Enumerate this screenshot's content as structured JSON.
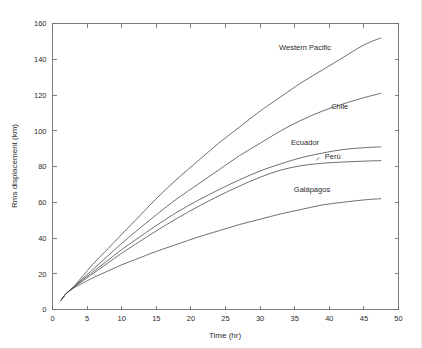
{
  "chart_data": {
    "type": "line",
    "title": "",
    "xlabel": "Time (hr)",
    "ylabel": "Rms displacement (km)",
    "xlim": [
      0,
      50
    ],
    "ylim": [
      0,
      160
    ],
    "xticks": [
      0,
      5,
      10,
      15,
      20,
      25,
      30,
      35,
      40,
      45,
      50
    ],
    "yticks": [
      0,
      20,
      40,
      60,
      80,
      100,
      120,
      140,
      160
    ],
    "grid": false,
    "legend_position": "inline-annotations",
    "line_color": "#555555",
    "series": [
      {
        "name": "Western Pacific",
        "label": "Western Pacific",
        "x": [
          1.2,
          2,
          3,
          4,
          6,
          8,
          10,
          12,
          15,
          18,
          21,
          24,
          27,
          30,
          33,
          36,
          39,
          42,
          45,
          47.5
        ],
        "values": [
          5,
          9,
          12.5,
          17,
          26,
          34,
          42,
          50,
          62,
          73,
          83,
          93,
          102,
          111,
          119,
          127,
          134,
          141,
          148,
          152
        ]
      },
      {
        "name": "Chile",
        "label": "Chile",
        "x": [
          1.2,
          2,
          3,
          4,
          6,
          8,
          10,
          12,
          15,
          18,
          21,
          24,
          27,
          30,
          33,
          36,
          39,
          42,
          45,
          47.5
        ],
        "values": [
          5,
          9,
          12.3,
          16,
          23,
          30,
          37,
          43.5,
          53,
          62,
          70,
          78,
          86,
          93,
          100,
          106,
          111,
          115,
          118.5,
          121
        ]
      },
      {
        "name": "Ecuador",
        "label": "Ecuador",
        "x": [
          1.2,
          2,
          3,
          4,
          6,
          8,
          10,
          12,
          15,
          18,
          21,
          24,
          27,
          30,
          33,
          36,
          39,
          42,
          45,
          47.5
        ],
        "values": [
          5,
          9,
          12.2,
          15.5,
          21.5,
          27.5,
          33.5,
          39,
          47,
          54.5,
          61,
          67,
          72.5,
          77.5,
          81.5,
          85,
          87.5,
          89.5,
          90.5,
          91
        ]
      },
      {
        "name": "Peru",
        "label": "Perú",
        "x": [
          1.2,
          2,
          3,
          4,
          6,
          8,
          10,
          12,
          15,
          18,
          21,
          24,
          27,
          30,
          33,
          36,
          39,
          42,
          45,
          47.5
        ],
        "values": [
          5,
          9,
          12.1,
          15,
          20.5,
          26,
          31.5,
          36.5,
          44,
          51,
          57.5,
          63.5,
          69,
          74,
          78,
          80.5,
          81.8,
          82.5,
          83,
          83.3
        ]
      },
      {
        "name": "Galapagos",
        "label": "Galápagos",
        "x": [
          1.2,
          2,
          3,
          4,
          6,
          8,
          10,
          12,
          15,
          18,
          21,
          24,
          27,
          30,
          33,
          36,
          39,
          42,
          45,
          47.5
        ],
        "values": [
          5,
          9,
          11.8,
          14,
          18,
          21.5,
          25,
          28,
          32.5,
          36.5,
          40.5,
          44,
          47.5,
          50.5,
          53.5,
          56,
          58.5,
          60,
          61.3,
          62
        ]
      }
    ],
    "annotations": [
      {
        "text": "Western Pacific",
        "x": 36.5,
        "y": 145
      },
      {
        "text": "Chile",
        "x": 41.5,
        "y": 112
      },
      {
        "text": "Ecuador",
        "x": 36.5,
        "y": 92
      },
      {
        "text": "Perú",
        "x": 40.5,
        "y": 84
      },
      {
        "text": "Galápagos",
        "x": 37.5,
        "y": 66
      }
    ]
  }
}
